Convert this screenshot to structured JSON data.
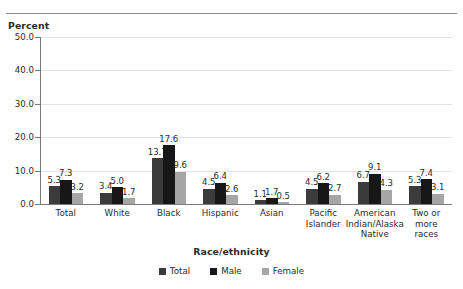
{
  "figure": {
    "title": "",
    "y_axis_title": "Percent",
    "x_axis_title": "Race/ethnicity"
  },
  "legend": {
    "items": [
      {
        "label": "Total",
        "color": "#3b3b3b"
      },
      {
        "label": "Male",
        "color": "#171717"
      },
      {
        "label": "Female",
        "color": "#a6a6a6"
      }
    ]
  },
  "chart_data": {
    "type": "bar",
    "title": "",
    "xlabel": "Race/ethnicity",
    "ylabel": "Percent",
    "ylim": [
      0,
      50
    ],
    "ytick_labels": [
      "0.0",
      "10.0",
      "20.0",
      "30.0",
      "40.0",
      "50.0"
    ],
    "ytick_values": [
      0,
      10,
      20,
      30,
      40,
      50
    ],
    "grid": true,
    "legend_position": "bottom",
    "categories": [
      "Total",
      "White",
      "Black",
      "Hispanic",
      "Asian",
      "Pacific Islander",
      "American Indian/Alaska Native",
      "Two or more races"
    ],
    "category_lines": [
      [
        "Total"
      ],
      [
        "White"
      ],
      [
        "Black"
      ],
      [
        "Hispanic"
      ],
      [
        "Asian"
      ],
      [
        "Pacific",
        "Islander"
      ],
      [
        "American",
        "Indian/Alaska",
        "Native"
      ],
      [
        "Two or",
        "more",
        "races"
      ]
    ],
    "series": [
      {
        "name": "Total",
        "color": "#3b3b3b",
        "values": [
          5.3,
          3.4,
          13.7,
          4.5,
          1.1,
          4.5,
          6.7,
          5.3
        ]
      },
      {
        "name": "Male",
        "color": "#171717",
        "values": [
          7.3,
          5.0,
          17.6,
          6.4,
          1.7,
          6.2,
          9.1,
          7.4
        ]
      },
      {
        "name": "Female",
        "color": "#a6a6a6",
        "values": [
          3.2,
          1.7,
          9.6,
          2.6,
          0.5,
          2.7,
          4.3,
          3.1
        ]
      }
    ],
    "value_labels": [
      [
        "5.3",
        "7.3",
        "3.2"
      ],
      [
        "3.4",
        "5.0",
        "1.7"
      ],
      [
        "13.7",
        "17.6",
        "9.6"
      ],
      [
        "4.5",
        "6.4",
        "2.6"
      ],
      [
        "1.1",
        "1.7",
        "0.5"
      ],
      [
        "4.5",
        "6.2",
        "2.7"
      ],
      [
        "6.7",
        "9.1",
        "4.3"
      ],
      [
        "5.3",
        "7.4",
        "3.1"
      ]
    ]
  }
}
